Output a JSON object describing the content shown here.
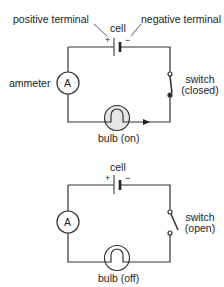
{
  "circuit_on": {
    "labels": {
      "positive_terminal": "positive terminal",
      "negative_terminal": "negative terminal",
      "cell": "cell",
      "plus": "+",
      "minus": "−",
      "ammeter": "ammeter",
      "ammeter_symbol": "A",
      "switch_line1": "switch",
      "switch_line2": "(closed)",
      "bulb": "bulb (on)"
    },
    "switch_state": "closed",
    "bulb_state": "on"
  },
  "circuit_off": {
    "labels": {
      "cell": "cell",
      "plus": "+",
      "minus": "−",
      "ammeter_symbol": "A",
      "switch_line1": "switch",
      "switch_line2": "(open)",
      "bulb": "bulb (off)"
    },
    "switch_state": "open",
    "bulb_state": "off"
  },
  "colors": {
    "wire": "#333333",
    "bulb_on_fill": "#e6e6e6",
    "bulb_off_fill": "#ffffff"
  }
}
